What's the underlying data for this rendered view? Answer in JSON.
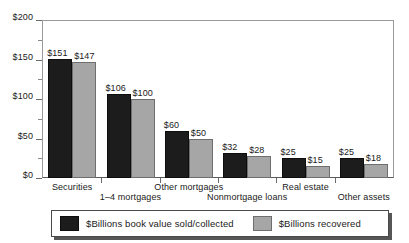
{
  "chart_data": {
    "type": "bar",
    "title": "",
    "subtitle": "",
    "xlabel": "",
    "ylabel": "",
    "ylim": [
      0,
      200
    ],
    "ytick_step": 50,
    "yminor_step": 25,
    "grid": false,
    "legend_position": "bottom",
    "value_prefix": "$",
    "categories": [
      "Securities",
      "1–4 mortgages",
      "Other mortgages",
      "Nonmortgage loans",
      "Real estate",
      "Other assets"
    ],
    "ytick_labels": [
      "$0",
      "$50",
      "$100",
      "$150",
      "$200"
    ],
    "ytick_values": [
      0,
      50,
      100,
      150,
      200
    ],
    "series": [
      {
        "name": "$Billions book value sold/collected",
        "color": "#1c1c1c",
        "values": [
          151,
          106,
          60,
          32,
          25,
          25
        ],
        "value_labels": [
          "$151",
          "$106",
          "$60",
          "$32",
          "$25",
          "$25"
        ]
      },
      {
        "name": "$Billions recovered",
        "color": "#a6a6a6",
        "values": [
          147,
          100,
          50,
          28,
          15,
          18
        ],
        "value_labels": [
          "$147",
          "$100",
          "$50",
          "$28",
          "$15",
          "$18"
        ]
      }
    ]
  },
  "legend": {
    "items": [
      {
        "label": "$Billions book value sold/collected",
        "swatch": "black-swatch-icon"
      },
      {
        "label": "$Billions recovered",
        "swatch": "gray-swatch-icon"
      }
    ]
  }
}
